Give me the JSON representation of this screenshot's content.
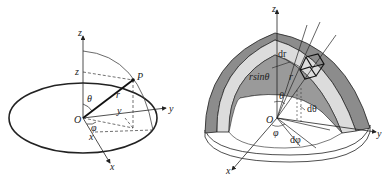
{
  "left_figure": {
    "axes": {
      "x": "x",
      "y": "y",
      "z": "z"
    },
    "origin": "O",
    "point": "P",
    "radius": "r",
    "polar_angle": "θ",
    "azimuth_angle": "φ",
    "projections": {
      "x": "x",
      "y": "y",
      "z": "z"
    }
  },
  "right_figure": {
    "axes": {
      "x": "x",
      "y": "y",
      "z": "z"
    },
    "origin": "O",
    "labels": {
      "dr": "dr",
      "rsin": "rsinθ",
      "r": "r",
      "theta": "θ",
      "dtheta": "dθ",
      "phi": "φ",
      "dphi": "dφ"
    },
    "colors": {
      "outer_shell": "#8c8c8c",
      "inner_band": "#dcdcdc",
      "inner_cavity": "#9a9a9a",
      "line": "#222222"
    }
  }
}
